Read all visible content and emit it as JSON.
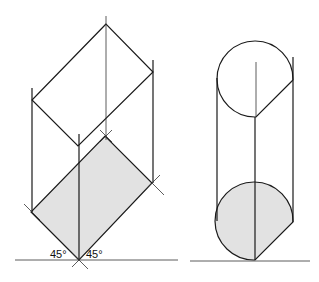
{
  "figure": {
    "left_drawing": {
      "name": "square prism with 45° projection",
      "angle_labels": [
        "45°",
        "45°"
      ]
    },
    "right_drawing": {
      "name": "cylinder projection"
    }
  },
  "colors": {
    "line": "#1a1a1a",
    "shade": "#e2e2e2",
    "background": "#ffffff"
  }
}
